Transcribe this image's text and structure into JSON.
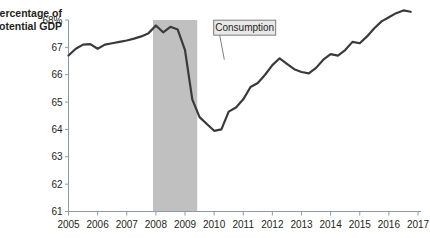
{
  "chart_data": {
    "type": "line",
    "title": "",
    "subtitle": "",
    "ylabel_line1": "Percentage of",
    "ylabel_line2": "potential GDP",
    "xlabel": "",
    "ylim": [
      61,
      68
    ],
    "xlim": [
      2005,
      2017
    ],
    "grid": false,
    "legend_position": "inline-annotation",
    "y_ticks": [
      "61",
      "62",
      "63",
      "64",
      "65",
      "66",
      "67",
      "68%"
    ],
    "y_tick_values": [
      61,
      62,
      63,
      64,
      65,
      66,
      67,
      68
    ],
    "x_ticks": [
      "2005",
      "2006",
      "2007",
      "2008",
      "2009",
      "2010",
      "2011",
      "2012",
      "2013",
      "2014",
      "2015",
      "2016",
      "2017"
    ],
    "x_tick_values": [
      2005,
      2006,
      2007,
      2008,
      2009,
      2010,
      2011,
      2012,
      2013,
      2014,
      2015,
      2016,
      2017
    ],
    "annotations": [
      {
        "label": "Consumption",
        "box_x": 2011.05,
        "box_y": 67.72,
        "leader_to_x": 2010.35,
        "leader_to_y": 66.55
      }
    ],
    "shaded_regions": [
      {
        "name": "recession-band",
        "x_start": 2007.9,
        "x_end": 2009.42,
        "color": "#c0c0c0"
      }
    ],
    "series": [
      {
        "name": "Consumption",
        "color": "#3a3a3a",
        "line_width": 2.2,
        "x": [
          2005.0,
          2005.25,
          2005.5,
          2005.75,
          2006.0,
          2006.25,
          2006.5,
          2006.75,
          2007.0,
          2007.25,
          2007.5,
          2007.75,
          2008.0,
          2008.25,
          2008.5,
          2008.75,
          2009.0,
          2009.25,
          2009.5,
          2009.75,
          2010.0,
          2010.25,
          2010.5,
          2010.75,
          2011.0,
          2011.25,
          2011.5,
          2011.75,
          2012.0,
          2012.25,
          2012.5,
          2012.75,
          2013.0,
          2013.25,
          2013.5,
          2013.75,
          2014.0,
          2014.25,
          2014.5,
          2014.75,
          2015.0,
          2015.25,
          2015.5,
          2015.75,
          2016.0,
          2016.25,
          2016.5,
          2016.75
        ],
        "y": [
          66.7,
          66.95,
          67.1,
          67.12,
          66.95,
          67.1,
          67.15,
          67.2,
          67.25,
          67.32,
          67.4,
          67.52,
          67.8,
          67.55,
          67.75,
          67.65,
          66.9,
          65.1,
          64.45,
          64.2,
          63.95,
          64.0,
          64.65,
          64.8,
          65.1,
          65.55,
          65.7,
          66.0,
          66.35,
          66.6,
          66.4,
          66.2,
          66.1,
          66.05,
          66.25,
          66.55,
          66.75,
          66.7,
          66.9,
          67.2,
          67.15,
          67.4,
          67.7,
          67.95,
          68.1,
          68.25,
          68.35,
          68.3
        ]
      }
    ]
  },
  "axes": {
    "axis_color": "#8d9aa8",
    "tick_color": "#8d9aa8",
    "background": "#ffffff"
  },
  "annotation_box": {
    "fill": "#e8e8e8",
    "stroke": "#6f6f6f",
    "text_color": "#231f20"
  }
}
